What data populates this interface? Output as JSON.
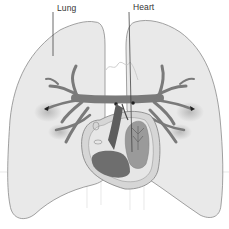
{
  "diagram": {
    "labels": {
      "lung": "Lung",
      "heart": "Heart"
    },
    "colors": {
      "lung_fill": "#e9e9e9",
      "lung_outline": "#8a8a8a",
      "vessel": "#7a7a7a",
      "heart_outer": "#d6d6d6",
      "heart_chamber_dark": "#6e6e6e",
      "heart_chamber_mid": "#9a9a9a",
      "label_text": "#333333",
      "leader_line": "#444444"
    },
    "parts": [
      "left-lung",
      "right-lung",
      "pulmonary-vessels",
      "heart",
      "trachea-outline"
    ]
  }
}
